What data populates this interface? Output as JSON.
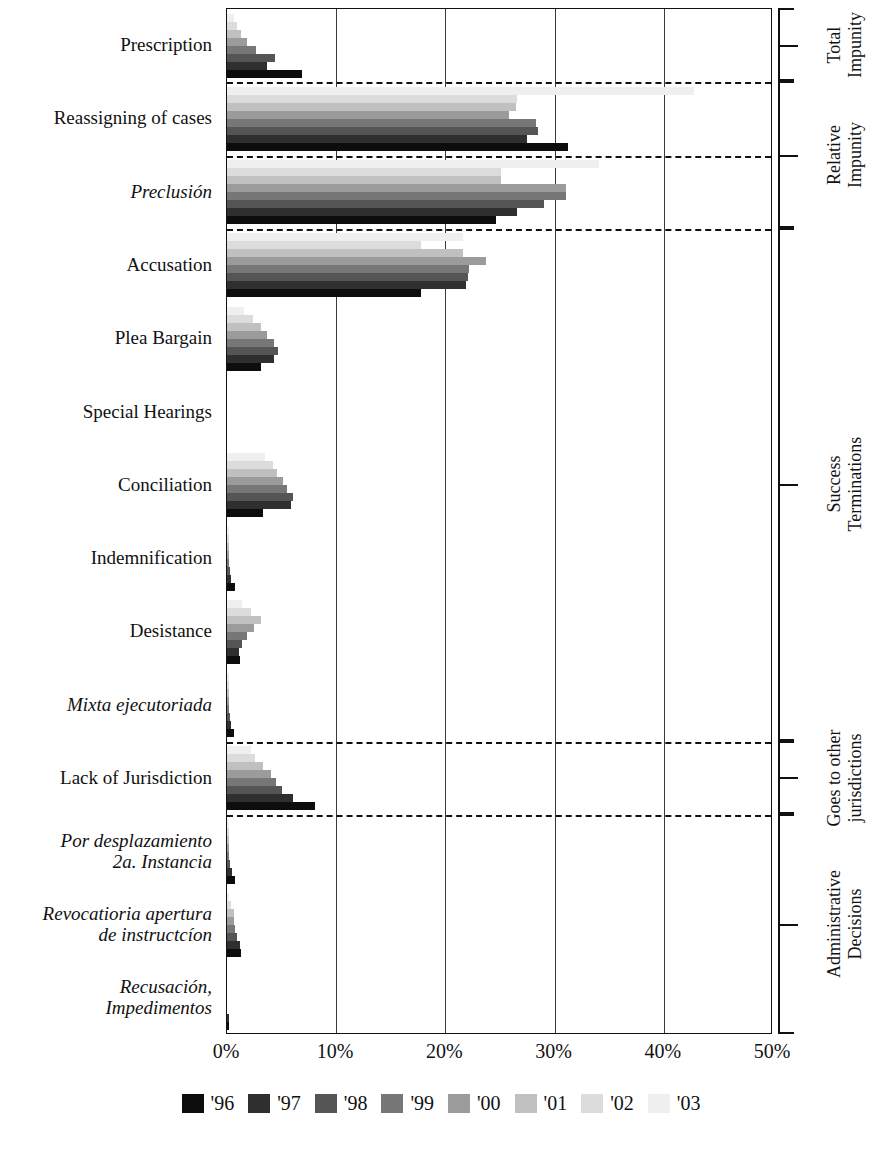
{
  "chart_data": {
    "type": "bar",
    "orientation": "horizontal",
    "title": "",
    "xlabel": "",
    "ylabel": "",
    "xlim": [
      0,
      50
    ],
    "xticks": [
      "0%",
      "10%",
      "20%",
      "30%",
      "40%",
      "50%"
    ],
    "xtick_values": [
      0,
      10,
      20,
      30,
      40,
      50
    ],
    "grid": true,
    "legend_position": "bottom",
    "series": [
      {
        "name": "'96",
        "color": "#0d0d0d"
      },
      {
        "name": "'97",
        "color": "#2f2f2f"
      },
      {
        "name": "'98",
        "color": "#555555"
      },
      {
        "name": "'99",
        "color": "#777777"
      },
      {
        "name": "'00",
        "color": "#9b9b9b"
      },
      {
        "name": "'01",
        "color": "#c0c0c0"
      },
      {
        "name": "'02",
        "color": "#dcdcdc"
      },
      {
        "name": "'03",
        "color": "#efefef"
      }
    ],
    "categories": [
      {
        "label": "Prescription",
        "italic": false,
        "values": {
          "'96": 6.9,
          "'97": 3.7,
          "'98": 4.4,
          "'99": 2.7,
          "'00": 1.8,
          "'01": 1.3,
          "'02": 0.9,
          "'03": 0.6
        }
      },
      {
        "label": "Reassigning of cases",
        "italic": false,
        "values": {
          "'96": 31.2,
          "'97": 27.5,
          "'98": 28.5,
          "'99": 28.3,
          "'00": 25.8,
          "'01": 26.5,
          "'02": 26.6,
          "'03": 42.8
        }
      },
      {
        "label": "Preclusión",
        "italic": true,
        "values": {
          "'96": 24.6,
          "'97": 26.6,
          "'98": 29.0,
          "'99": 31.0,
          "'00": 31.0,
          "'01": 25.1,
          "'02": 25.1,
          "'03": 34.1
        }
      },
      {
        "label": "Accusation",
        "italic": false,
        "values": {
          "'96": 17.8,
          "'97": 21.9,
          "'98": 22.1,
          "'99": 22.2,
          "'00": 23.7,
          "'01": 21.6,
          "'02": 17.8,
          "'03": 21.6
        }
      },
      {
        "label": "Plea Bargain",
        "italic": false,
        "values": {
          "'96": 3.1,
          "'97": 4.3,
          "'98": 4.7,
          "'99": 4.3,
          "'00": 3.7,
          "'01": 3.1,
          "'02": 2.4,
          "'03": 1.6
        }
      },
      {
        "label": "Special Hearings",
        "italic": false,
        "values": {
          "'96": 0.0,
          "'97": 0.0,
          "'98": 0.0,
          "'99": 0.0,
          "'00": 0.0,
          "'01": 0.0,
          "'02": 0.0,
          "'03": 0.0
        }
      },
      {
        "label": "Conciliation",
        "italic": false,
        "values": {
          "'96": 3.3,
          "'97": 5.9,
          "'98": 6.0,
          "'99": 5.5,
          "'00": 5.1,
          "'01": 4.6,
          "'02": 4.2,
          "'03": 3.5
        }
      },
      {
        "label": "Indemnification",
        "italic": false,
        "values": {
          "'96": 0.7,
          "'97": 0.4,
          "'98": 0.3,
          "'99": 0.2,
          "'00": 0.2,
          "'01": 0.2,
          "'02": 0.2,
          "'03": 0.1
        }
      },
      {
        "label": "Desistance",
        "italic": false,
        "values": {
          "'96": 1.2,
          "'97": 1.1,
          "'98": 1.4,
          "'99": 1.8,
          "'00": 2.5,
          "'01": 3.1,
          "'02": 2.2,
          "'03": 1.4
        }
      },
      {
        "label": "Mixta ejecutoriada",
        "italic": true,
        "values": {
          "'96": 0.6,
          "'97": 0.4,
          "'98": 0.3,
          "'99": 0.2,
          "'00": 0.2,
          "'01": 0.1,
          "'02": 0.1,
          "'03": 0.1
        }
      },
      {
        "label": "Lack of Jurisdiction",
        "italic": false,
        "values": {
          "'96": 8.1,
          "'97": 6.0,
          "'98": 5.0,
          "'99": 4.5,
          "'00": 4.0,
          "'01": 3.3,
          "'02": 2.6,
          "'03": 2.2
        }
      },
      {
        "label": "Por desplazamiento\n2a. Instancia",
        "italic": true,
        "values": {
          "'96": 0.7,
          "'97": 0.5,
          "'98": 0.3,
          "'99": 0.2,
          "'00": 0.2,
          "'01": 0.1,
          "'02": 0.1,
          "'03": 0.1
        }
      },
      {
        "label": "Revocatioria apertura\nde instructcíon",
        "italic": true,
        "values": {
          "'96": 1.3,
          "'97": 1.2,
          "'98": 0.9,
          "'99": 0.7,
          "'00": 0.6,
          "'01": 0.6,
          "'02": 0.4,
          "'03": 0.2
        }
      },
      {
        "label": "Recusación,\nImpedimentos",
        "italic": true,
        "values": {
          "'96": 0.1,
          "'97": 0.1,
          "'98": 0.0,
          "'99": 0.0,
          "'00": 0.0,
          "'01": 0.0,
          "'02": 0.0,
          "'03": 0.0
        }
      }
    ],
    "separators_after": [
      "Prescription",
      "Reassigning of cases",
      "Preclusión",
      "Mixta ejecutoriada",
      "Lack of Jurisdiction"
    ],
    "group_brackets": [
      {
        "label": "Total\nImpunity",
        "from": "Prescription",
        "to": "Prescription"
      },
      {
        "label": "Relative\nImpunity",
        "from": "Reassigning of cases",
        "to": "Preclusión"
      },
      {
        "label": "Success\nTerminations",
        "from": "Accusation",
        "to": "Mixta ejecutoriada"
      },
      {
        "label": "Goes to other\njurisdictions",
        "from": "Lack of Jurisdiction",
        "to": "Lack of Jurisdiction"
      },
      {
        "label": "Administrative\nDecisions",
        "from": "Por desplazamiento\n2a. Instancia",
        "to": "Recusación,\nImpedimentos"
      }
    ]
  }
}
